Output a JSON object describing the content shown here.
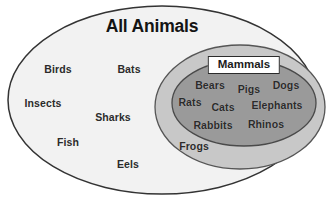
{
  "diagram": {
    "type": "venn-nested-ellipses",
    "title": "All Animals",
    "background_color": "#ffffff",
    "text_color": "#2b2b2b",
    "sets": [
      {
        "name": "All Animals",
        "level": 0,
        "fill_color": "#f2f2f2",
        "stroke_color": "#333333",
        "label": "All Animals",
        "members": [
          "Birds",
          "Bats",
          "Insects",
          "Sharks",
          "Fish",
          "Eels"
        ]
      },
      {
        "name": "Vertebrates",
        "level": 1,
        "fill_color": "#c8c8c8",
        "stroke_color": "#555555",
        "label": "",
        "members": [
          "Frogs"
        ]
      },
      {
        "name": "Mammals",
        "level": 2,
        "fill_color": "#9a9a9a",
        "stroke_color": "#4a4a4a",
        "label": "Mammals",
        "members": [
          "Bears",
          "Pigs",
          "Dogs",
          "Rats",
          "Cats",
          "Elephants",
          "Rabbits",
          "Rhinos"
        ]
      }
    ],
    "labels": [
      {
        "text": "Birds",
        "x": 58,
        "y": 69,
        "set": "All Animals"
      },
      {
        "text": "Bats",
        "x": 129,
        "y": 69,
        "set": "All Animals"
      },
      {
        "text": "Insects",
        "x": 43,
        "y": 103,
        "set": "All Animals"
      },
      {
        "text": "Sharks",
        "x": 113,
        "y": 117,
        "set": "All Animals"
      },
      {
        "text": "Fish",
        "x": 68,
        "y": 142,
        "set": "All Animals"
      },
      {
        "text": "Eels",
        "x": 128,
        "y": 164,
        "set": "All Animals"
      },
      {
        "text": "Frogs",
        "x": 194,
        "y": 146,
        "set": "Vertebrates"
      },
      {
        "text": "Bears",
        "x": 210,
        "y": 85,
        "set": "Mammals"
      },
      {
        "text": "Pigs",
        "x": 249,
        "y": 89,
        "set": "Mammals"
      },
      {
        "text": "Dogs",
        "x": 286,
        "y": 85,
        "set": "Mammals"
      },
      {
        "text": "Rats",
        "x": 190,
        "y": 102,
        "set": "Mammals"
      },
      {
        "text": "Cats",
        "x": 223,
        "y": 107,
        "set": "Mammals"
      },
      {
        "text": "Elephants",
        "x": 277,
        "y": 105,
        "set": "Mammals"
      },
      {
        "text": "Rabbits",
        "x": 213,
        "y": 125,
        "set": "Mammals"
      },
      {
        "text": "Rhinos",
        "x": 266,
        "y": 124,
        "set": "Mammals"
      }
    ],
    "title_position": {
      "x": 152,
      "y": 26
    },
    "mammals_label_position": {
      "x": 244,
      "y": 65
    }
  }
}
